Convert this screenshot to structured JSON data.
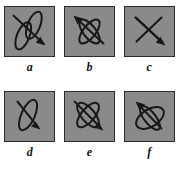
{
  "figure": {
    "title": "",
    "panel_count": 6,
    "rows": 2,
    "columns": 3,
    "background_color": "#ffffff",
    "panel_fill_color": "#8a8a8a",
    "panel_border_color": "#2b2b2b",
    "curve_color": "#181818",
    "label_color": "#141414"
  },
  "panels": [
    {
      "label": "a",
      "icon_name": "two-parallel-ellipses-with-diagonal-arrow",
      "description": "Two narrow parallel ellipses tilted toward upper right, with a straight arrow running diagonally from upper left to lower right",
      "ellipse_count": 2,
      "arrow_direction": "down-right"
    },
    {
      "label": "b",
      "icon_name": "two-crossing-ellipses-with-up-left-arrow",
      "description": "Two narrow ellipses crossing at their centers forming an X, with an arrow pointing toward the upper left",
      "ellipse_count": 2,
      "arrow_direction": "up-left"
    },
    {
      "label": "c",
      "icon_name": "crossed-lines-with-down-right-arrow",
      "description": "Two straight crossing lines forming an X (degenerate ellipses), with an arrow pointing toward the lower right",
      "ellipse_count": 0,
      "arrow_direction": "down-right"
    },
    {
      "label": "d",
      "icon_name": "single-narrow-ellipse-with-down-right-arrow",
      "description": "A single narrow ellipse tilted toward the upper left, with an arrow pointing toward the lower right",
      "ellipse_count": 1,
      "arrow_direction": "down-right"
    },
    {
      "label": "e",
      "icon_name": "two-crossing-ellipses-with-down-right-arrow",
      "description": "Two narrow ellipses crossing at their centers forming an X, with an arrow pointing toward the lower right",
      "ellipse_count": 2,
      "arrow_direction": "down-right"
    },
    {
      "label": "f",
      "icon_name": "two-crossing-ellipses-with-up-left-arrow",
      "description": "A broad ellipse crossed by a narrow ellipse, with an arrow pointing toward the upper left",
      "ellipse_count": 2,
      "arrow_direction": "up-left"
    }
  ]
}
